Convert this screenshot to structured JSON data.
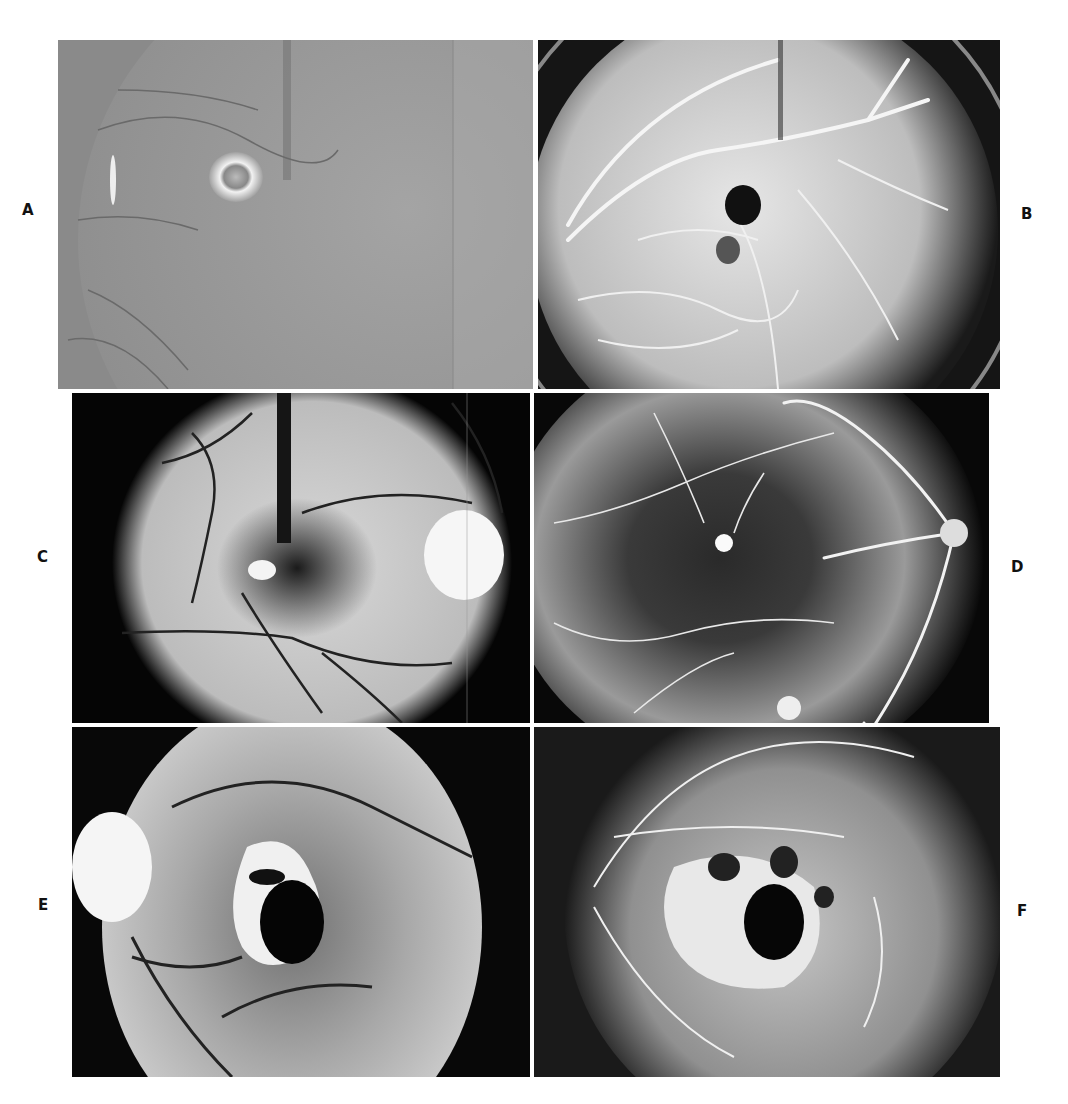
{
  "figure": {
    "panels": [
      {
        "id": "A",
        "label": "A",
        "description": "Red-free fundus photograph, gray tone, bright ring-shaped lesion near fovea"
      },
      {
        "id": "B",
        "label": "B",
        "description": "Fluorescein angiogram, bright vessels with dark central lesion"
      },
      {
        "id": "C",
        "label": "C",
        "description": "Fundus photograph with dark vessels, bright optic disc on right, small bright lesion"
      },
      {
        "id": "D",
        "label": "D",
        "description": "Fluorescein angiogram, bright vessels, optic disc on right, small hyperfluorescent spot"
      },
      {
        "id": "E",
        "label": "E",
        "description": "Fundus photograph with large dark central lesion surrounded by white patches, optic disc on left"
      },
      {
        "id": "F",
        "label": "F",
        "description": "Late-phase fluorescein angiogram with dark central lesion and mottled hyperfluorescence"
      }
    ]
  }
}
